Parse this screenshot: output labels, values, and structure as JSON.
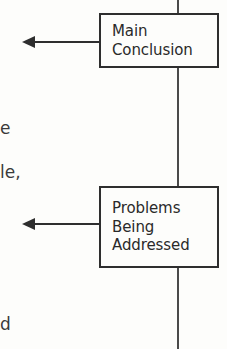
{
  "figure": {
    "type": "flowchart-fragment",
    "background_color": "#fdfdfb",
    "ink_color": "#2e2e2e",
    "spine": {
      "name": "vertical-connector",
      "x": 177,
      "top": 0,
      "bottom": 349
    },
    "nodes": [
      {
        "id": "main-conclusion",
        "lines": [
          "Main",
          "Conclusion"
        ],
        "x": 99,
        "y": 13,
        "width": 120,
        "height": 55
      },
      {
        "id": "problems-being-addressed",
        "lines": [
          "Problems",
          "Being",
          "Addressed"
        ],
        "x": 99,
        "y": 186,
        "width": 120,
        "height": 82
      }
    ],
    "arrows": [
      {
        "id": "arrow-from-main-conclusion",
        "direction": "left",
        "y": 42,
        "tip_x": 22,
        "tail_x": 99
      },
      {
        "id": "arrow-from-problems",
        "direction": "left",
        "y": 224,
        "tip_x": 22,
        "tail_x": 99
      }
    ],
    "margin_text_fragments": [
      {
        "id": "fragment-upper",
        "text": "e",
        "x": 0,
        "y": 120
      },
      {
        "id": "fragment-middle",
        "text": "le,",
        "x": 0,
        "y": 164
      },
      {
        "id": "fragment-lower",
        "text": "d",
        "x": 0,
        "y": 316
      }
    ]
  }
}
